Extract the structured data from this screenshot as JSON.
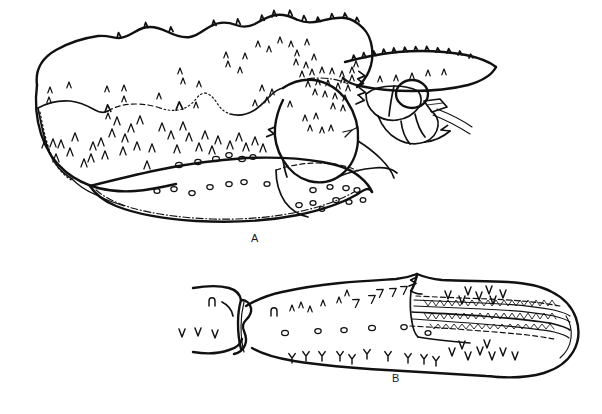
{
  "plate": {
    "kind": "scientific-line-drawing",
    "subject": "crustacean-morphology",
    "background_color": "#ffffff",
    "ink_color": "#111111",
    "width": 602,
    "height": 414
  },
  "figures": [
    {
      "id": "A",
      "label": "A",
      "caption_text": "A",
      "description": "lateral view of carapace and cephalic region with rostrum, eye, antennae and mouthparts",
      "label_x": 251,
      "label_y": 232
    },
    {
      "id": "B",
      "label": "B",
      "caption_text": "B",
      "description": "lateral view of an elongate segmented appendage article with distal comb rows of serrate setae",
      "label_x": 392,
      "label_y": 372
    }
  ],
  "annotations": {
    "figure_a_features": [
      "dorsal-carapace-margin",
      "rostrum-spine",
      "eye",
      "antennal-flagellum",
      "maxilliped",
      "branchial-region",
      "ventral-margin",
      "setae-chevrons",
      "punctation-pores"
    ],
    "figure_b_features": [
      "proximal-articulation",
      "segment-joint",
      "dorsal-margin-setae",
      "ventral-margin-setae",
      "serrate-comb-rows",
      "rounded-distal-end",
      "punctation-pores"
    ]
  }
}
